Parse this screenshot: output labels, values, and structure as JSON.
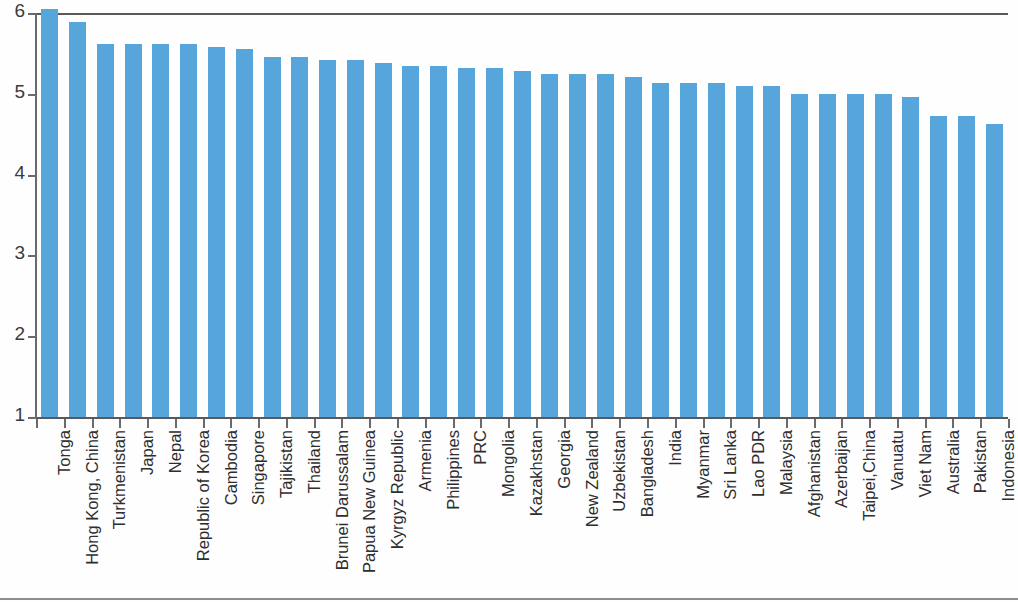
{
  "chart_data": {
    "type": "bar",
    "title": "",
    "subtitle": "",
    "xlabel": "",
    "ylabel": "",
    "ylim": [
      1,
      6
    ],
    "yticks": [
      1,
      2,
      3,
      4,
      5,
      6
    ],
    "ytick_labels": [
      "1",
      "2",
      "3",
      "4",
      "5",
      "6"
    ],
    "grid": false,
    "legend": null,
    "bar_color": "#56a5db",
    "axis_color": "#59595b",
    "categories": [
      "Tonga",
      "Hong Kong, China",
      "Turkmenistan",
      "Japan",
      "Nepal",
      "Republic of Korea",
      "Cambodia",
      "Singapore",
      "Tajikistan",
      "Thailand",
      "Brunei Darussalam",
      "Papua New Guinea",
      "Kyrgyz Republic",
      "Armenia",
      "Philippines",
      "PRC",
      "Mongolia",
      "Kazakhstan",
      "Georgia",
      "New Zealand",
      "Uzbekistan",
      "Bangladesh",
      "India",
      "Myanmar",
      "Sri Lanka",
      "Lao PDR",
      "Malaysia",
      "Afghanistan",
      "Azerbaijan",
      "Taipei,China",
      "Vanuatu",
      "Viet Nam",
      "Australia",
      "Pakistan",
      "Indonesia"
    ],
    "values": [
      6.05,
      5.89,
      5.62,
      5.62,
      5.62,
      5.62,
      5.58,
      5.55,
      5.45,
      5.45,
      5.42,
      5.42,
      5.38,
      5.35,
      5.35,
      5.32,
      5.32,
      5.28,
      5.25,
      5.25,
      5.25,
      5.21,
      5.13,
      5.13,
      5.13,
      5.1,
      5.1,
      5.0,
      5.0,
      5.0,
      5.0,
      4.96,
      4.72,
      4.72,
      4.63
    ]
  }
}
